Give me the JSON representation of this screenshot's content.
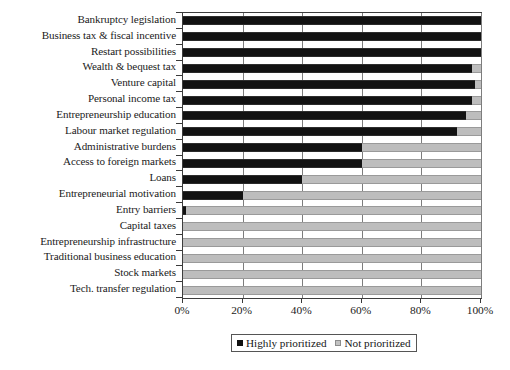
{
  "chart_data": {
    "type": "bar",
    "orientation": "horizontal",
    "stacked": true,
    "title": "",
    "xlabel": "",
    "ylabel": "",
    "xlim": [
      0,
      100
    ],
    "xticks": [
      0,
      20,
      40,
      60,
      80,
      100
    ],
    "xtick_labels": [
      "0%",
      "20%",
      "40%",
      "60%",
      "80%",
      "100%"
    ],
    "grid": "vertical",
    "legend_position": "bottom",
    "categories": [
      "Bankruptcy legislation",
      "Business tax & fiscal incentive",
      "Restart possibilities",
      "Wealth & bequest tax",
      "Venture capital",
      "Personal income tax",
      "Entrepreneurship education",
      "Labour market regulation",
      "Administrative burdens",
      "Access to foreign markets",
      "Loans",
      "Entrepreneurial motivation",
      "Entry barriers",
      "Capital taxes",
      "Entrepreneurship infrastructure",
      "Traditional business education",
      "Stock markets",
      "Tech. transfer regulation"
    ],
    "series": [
      {
        "name": "Highly prioritized",
        "color": "#121212",
        "values": [
          100,
          100,
          100,
          97,
          98,
          97,
          95,
          92,
          60,
          60,
          40,
          20,
          1,
          0,
          0,
          0,
          0,
          0
        ]
      },
      {
        "name": "Not prioritized",
        "color": "#bdbdbd",
        "values": [
          0,
          0,
          0,
          3,
          2,
          3,
          5,
          8,
          40,
          40,
          60,
          80,
          99,
          100,
          100,
          100,
          100,
          100
        ]
      }
    ]
  },
  "legend": {
    "items": [
      {
        "label": "Highly prioritized",
        "swatch": "black-square"
      },
      {
        "label": "Not prioritized",
        "swatch": "gray-square"
      }
    ]
  }
}
